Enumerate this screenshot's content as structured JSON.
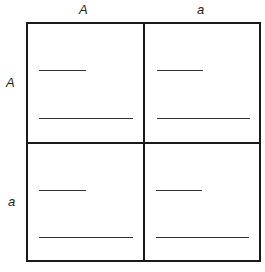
{
  "punnett_square": {
    "column_headers": [
      "A",
      "a"
    ],
    "row_headers": [
      "A",
      "a"
    ],
    "cells": [
      {
        "row": 0,
        "col": 0,
        "blanks": [
          "",
          ""
        ]
      },
      {
        "row": 0,
        "col": 1,
        "blanks": [
          "",
          ""
        ]
      },
      {
        "row": 1,
        "col": 0,
        "blanks": [
          "",
          ""
        ]
      },
      {
        "row": 1,
        "col": 1,
        "blanks": [
          "",
          ""
        ]
      }
    ]
  }
}
